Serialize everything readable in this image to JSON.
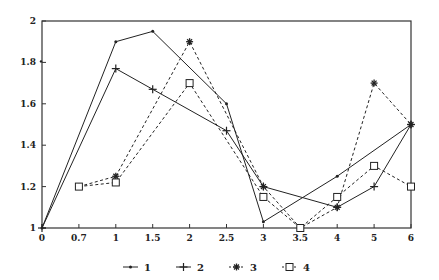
{
  "chart_data": {
    "type": "line",
    "title": "",
    "xlabel": "",
    "ylabel": "",
    "x_categories": [
      "0",
      "0.7",
      "1",
      "1.5",
      "2",
      "2.5",
      "3",
      "3.5",
      "4",
      "5",
      "6"
    ],
    "x_scale": "categorical-evenly-spaced",
    "ylim": [
      1,
      2
    ],
    "y_ticks": [
      "1",
      "1.2",
      "1.4",
      "1.6",
      "1.8",
      "2"
    ],
    "y_tick_values": [
      1,
      1.2,
      1.4,
      1.6,
      1.8,
      2
    ],
    "grid": false,
    "legend_position": "bottom-center",
    "series": [
      {
        "name": "1",
        "line_style": "solid",
        "marker": "dot",
        "points": [
          {
            "x": "0",
            "y": 1.0
          },
          {
            "x": "1",
            "y": 1.9
          },
          {
            "x": "1.5",
            "y": 1.95
          },
          {
            "x": "2.5",
            "y": 1.6
          },
          {
            "x": "3",
            "y": 1.03
          },
          {
            "x": "4",
            "y": 1.25
          },
          {
            "x": "6",
            "y": 1.5
          }
        ]
      },
      {
        "name": "2",
        "line_style": "solid",
        "marker": "plus",
        "points": [
          {
            "x": "0",
            "y": 1.0
          },
          {
            "x": "1",
            "y": 1.77
          },
          {
            "x": "1.5",
            "y": 1.67
          },
          {
            "x": "2.5",
            "y": 1.47
          },
          {
            "x": "3",
            "y": 1.2
          },
          {
            "x": "4",
            "y": 1.1
          },
          {
            "x": "5",
            "y": 1.2
          },
          {
            "x": "6",
            "y": 1.5
          }
        ]
      },
      {
        "name": "3",
        "line_style": "dashed",
        "marker": "asterisk",
        "points": [
          {
            "x": "0.7",
            "y": 1.2
          },
          {
            "x": "1",
            "y": 1.25
          },
          {
            "x": "2",
            "y": 1.9
          },
          {
            "x": "3",
            "y": 1.2
          },
          {
            "x": "3.5",
            "y": 1.0
          },
          {
            "x": "4",
            "y": 1.1
          },
          {
            "x": "5",
            "y": 1.7
          },
          {
            "x": "6",
            "y": 1.5
          }
        ]
      },
      {
        "name": "4",
        "line_style": "dashed",
        "marker": "square",
        "points": [
          {
            "x": "0.7",
            "y": 1.2
          },
          {
            "x": "1",
            "y": 1.22
          },
          {
            "x": "2",
            "y": 1.7
          },
          {
            "x": "3",
            "y": 1.15
          },
          {
            "x": "3.5",
            "y": 1.0
          },
          {
            "x": "4",
            "y": 1.15
          },
          {
            "x": "5",
            "y": 1.3
          },
          {
            "x": "6",
            "y": 1.2
          }
        ]
      }
    ],
    "annotations": [
      {
        "text": "stray dot near y-axis",
        "x": "0",
        "y": 1.8
      }
    ]
  },
  "colors": {
    "ink": "#222222",
    "background": "#ffffff"
  }
}
